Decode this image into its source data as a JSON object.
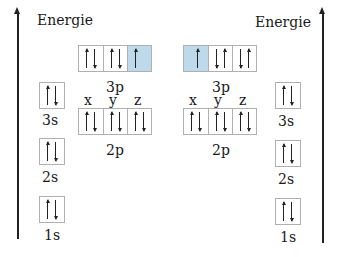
{
  "diagram": {
    "type": "orbital-energy-diagram",
    "axis_label": "Energie",
    "colors": {
      "highlight": "#bdd9ea",
      "box_border": "#b0b0b0",
      "ink": "#222222"
    },
    "left": {
      "axis_label": "Energie",
      "orbitals": {
        "3p": {
          "label": "3p",
          "boxes": [
            [
              "up",
              "down"
            ],
            [
              "up",
              "down"
            ],
            [
              "up"
            ]
          ],
          "highlighted_box": 2
        },
        "2p": {
          "label": "2p",
          "sublabels": [
            "x",
            "y",
            "z"
          ],
          "boxes": [
            [
              "up",
              "down"
            ],
            [
              "up",
              "down"
            ],
            [
              "up",
              "down"
            ]
          ]
        },
        "3s": {
          "label": "3s",
          "boxes": [
            [
              "up",
              "down"
            ]
          ]
        },
        "2s": {
          "label": "2s",
          "boxes": [
            [
              "up",
              "down"
            ]
          ]
        },
        "1s": {
          "label": "1s",
          "boxes": [
            [
              "up",
              "down"
            ]
          ]
        }
      }
    },
    "right": {
      "axis_label": "Energie",
      "orbitals": {
        "3p": {
          "label": "3p",
          "boxes": [
            [
              "up"
            ],
            [
              "down",
              "up"
            ],
            [
              "down",
              "up"
            ]
          ],
          "highlighted_box": 0
        },
        "2p": {
          "label": "2p",
          "sublabels": [
            "x",
            "y",
            "z"
          ],
          "boxes": [
            [
              "up",
              "down"
            ],
            [
              "up",
              "down"
            ],
            [
              "up",
              "down"
            ]
          ]
        },
        "3s": {
          "label": "3s",
          "boxes": [
            [
              "up",
              "down"
            ]
          ]
        },
        "2s": {
          "label": "2s",
          "boxes": [
            [
              "up",
              "down"
            ]
          ]
        },
        "1s": {
          "label": "1s",
          "boxes": [
            [
              "up",
              "down"
            ]
          ]
        }
      }
    }
  }
}
